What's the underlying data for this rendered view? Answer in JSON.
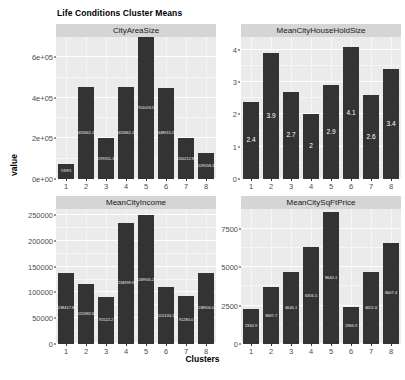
{
  "chart_data": {
    "type": "bar",
    "title": "Life Conditions Cluster Means",
    "xlabel": "Clusters",
    "ylabel": "value",
    "grid": true,
    "legend": "none",
    "facet_layout": "2x2",
    "categories": [
      "1",
      "2",
      "3",
      "4",
      "5",
      "6",
      "7",
      "8"
    ],
    "facets": [
      {
        "name": "CityAreaSize",
        "ylim": [
          0,
          700000
        ],
        "yticks": [
          0,
          200000,
          400000,
          600000
        ],
        "ytick_labels": [
          "0e+00",
          "2e+05",
          "4e+05",
          "6e+05"
        ],
        "values": [
          75000,
          455000,
          200000,
          455000,
          700000,
          450000,
          200000,
          130000
        ],
        "bar_labels": [
          "74991",
          "455661.1",
          "199311.1",
          "455861.1",
          "701003.5",
          "448915.5",
          "200212.8",
          "129558.1"
        ]
      },
      {
        "name": "MeanCityHouseHoldSize",
        "ylim": [
          0,
          4.4
        ],
        "yticks": [
          0,
          1,
          2,
          3,
          4
        ],
        "ytick_labels": [
          "0",
          "1",
          "2",
          "3",
          "4"
        ],
        "values": [
          2.4,
          3.9,
          2.7,
          2.0,
          2.9,
          4.1,
          2.6,
          3.4
        ],
        "bar_labels": [
          "2.4",
          "3.9",
          "2.7",
          "2",
          "2.9",
          "4.1",
          "2.6",
          "3.4"
        ]
      },
      {
        "name": "MeanCityIncome",
        "ylim": [
          0,
          262000
        ],
        "yticks": [
          0,
          50000,
          100000,
          150000,
          200000,
          250000
        ],
        "ytick_labels": [
          "0",
          "50000",
          "100000",
          "150000",
          "200000",
          "250000"
        ],
        "values": [
          138000,
          116000,
          92000,
          235000,
          250000,
          110000,
          93000,
          138000
        ],
        "bar_labels": [
          "138417.8",
          "115982.6",
          "91522.2",
          "234999.9",
          "249945.2",
          "110134.1",
          "91284.0",
          "138900.0"
        ]
      },
      {
        "name": "MeanCitySqFtPrice",
        "ylim": [
          0,
          8800
        ],
        "yticks": [
          0,
          2500,
          5000,
          7500
        ],
        "ytick_labels": [
          "0",
          "2500",
          "5000",
          "7500"
        ],
        "values": [
          2300,
          3700,
          4700,
          6300,
          8600,
          2400,
          4700,
          6600
        ],
        "bar_labels": [
          "2334.9",
          "3687.7",
          "4646.1",
          "6356.5",
          "8640.1",
          "2384.9",
          "4651.6",
          "6607.4"
        ]
      }
    ],
    "colors": {
      "bar": "#333333",
      "panel_background": "#ebebeb",
      "strip_background": "#d5d5d5",
      "grid": "#ffffff",
      "text": "#000000",
      "bar_label": "#ffffff"
    }
  }
}
